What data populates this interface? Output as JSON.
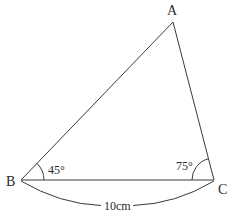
{
  "diagram": {
    "type": "triangle",
    "colors": {
      "stroke": "#3a3a3a",
      "text": "#2a2a2a",
      "background": "#ffffff"
    },
    "vertices": {
      "A": {
        "label": "A",
        "x": 173,
        "y": 22
      },
      "B": {
        "label": "B",
        "x": 21,
        "y": 180
      },
      "C": {
        "label": "C",
        "x": 214,
        "y": 180
      }
    },
    "angles": {
      "B": {
        "label": "45°",
        "degrees": 45
      },
      "C": {
        "label": "75°",
        "degrees": 75
      }
    },
    "sides": {
      "BC": {
        "label": "10cm"
      }
    }
  }
}
